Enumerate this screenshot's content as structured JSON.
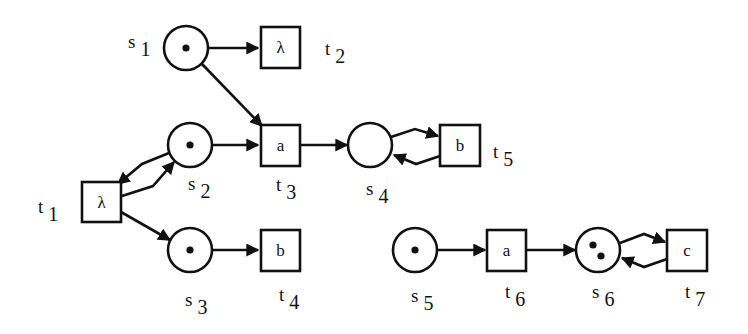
{
  "diagram": {
    "type": "petri-net",
    "places": [
      {
        "id": "s1",
        "letter": "s",
        "index": "1",
        "tokens": 1
      },
      {
        "id": "s2",
        "letter": "s",
        "index": "2",
        "tokens": 1
      },
      {
        "id": "s3",
        "letter": "s",
        "index": "3",
        "tokens": 1
      },
      {
        "id": "s4",
        "letter": "s",
        "index": "4",
        "tokens": 0
      },
      {
        "id": "s5",
        "letter": "s",
        "index": "5",
        "tokens": 1
      },
      {
        "id": "s6",
        "letter": "s",
        "index": "6",
        "tokens": 2
      }
    ],
    "transitions": [
      {
        "id": "t1",
        "letter": "t",
        "index": "1",
        "action": "λ"
      },
      {
        "id": "t2",
        "letter": "t",
        "index": "2",
        "action": "λ"
      },
      {
        "id": "t3",
        "letter": "t",
        "index": "3",
        "action": "a"
      },
      {
        "id": "t4",
        "letter": "t",
        "index": "4",
        "action": "b"
      },
      {
        "id": "t5",
        "letter": "t",
        "index": "5",
        "action": "b"
      },
      {
        "id": "t6",
        "letter": "t",
        "index": "6",
        "action": "a"
      },
      {
        "id": "t7",
        "letter": "t",
        "index": "7",
        "action": "c"
      }
    ],
    "arcs": [
      {
        "from": "s1",
        "to": "t2"
      },
      {
        "from": "s1",
        "to": "t3"
      },
      {
        "from": "s2",
        "to": "t3"
      },
      {
        "from": "s2",
        "to": "t1"
      },
      {
        "from": "t1",
        "to": "s2"
      },
      {
        "from": "t1",
        "to": "s3"
      },
      {
        "from": "s3",
        "to": "t4"
      },
      {
        "from": "t3",
        "to": "s4"
      },
      {
        "from": "s4",
        "to": "t5"
      },
      {
        "from": "t5",
        "to": "s4"
      },
      {
        "from": "s5",
        "to": "t6"
      },
      {
        "from": "t6",
        "to": "s6"
      },
      {
        "from": "s6",
        "to": "t7"
      },
      {
        "from": "t7",
        "to": "s6"
      }
    ]
  }
}
